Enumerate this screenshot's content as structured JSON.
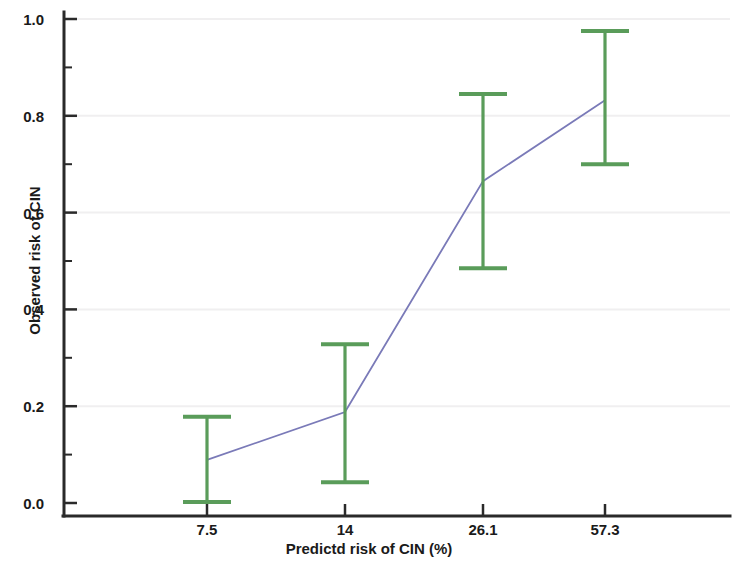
{
  "chart_data": {
    "type": "line",
    "title": "",
    "xlabel": "Predictd risk of CIN (%)",
    "ylabel": "Observed risk of CIN",
    "categories": [
      "7.5",
      "14",
      "26.1",
      "57.3"
    ],
    "x_tick_labels": [
      "7.5",
      "14",
      "26.1",
      "57.3"
    ],
    "y_tick_labels": [
      "0.0",
      "0.2",
      "0.4",
      "0.6",
      "0.8",
      "1.0"
    ],
    "y_tick_values": [
      0.0,
      0.2,
      0.4,
      0.6,
      0.8,
      1.0
    ],
    "y_minor_tick_values": [
      0.1,
      0.3,
      0.5,
      0.7,
      0.9
    ],
    "ylim": [
      0.0,
      1.0
    ],
    "grid": true,
    "legend": "none",
    "series": [
      {
        "name": "Observed risk of CIN",
        "values": [
          0.089,
          0.188,
          0.665,
          0.832
        ],
        "error_low": [
          0.002,
          0.043,
          0.485,
          0.7
        ],
        "error_high": [
          0.178,
          0.328,
          0.845,
          0.975
        ]
      }
    ],
    "points": [
      {
        "category": "7.5",
        "value": 0.089,
        "lower": 0.002,
        "upper": 0.178
      },
      {
        "category": "14",
        "value": 0.188,
        "lower": 0.043,
        "upper": 0.328
      },
      {
        "category": "26.1",
        "value": 0.665,
        "lower": 0.485,
        "upper": 0.845
      },
      {
        "category": "57.3",
        "value": 0.832,
        "lower": 0.7,
        "upper": 0.975
      }
    ],
    "colors": {
      "line": "#7a7ab8",
      "errorbar": "#5a9c5a",
      "axis": "#2a2a2a",
      "grid": "#f0eff0",
      "text": "#1a1a1a",
      "background": "#ffffff"
    }
  }
}
